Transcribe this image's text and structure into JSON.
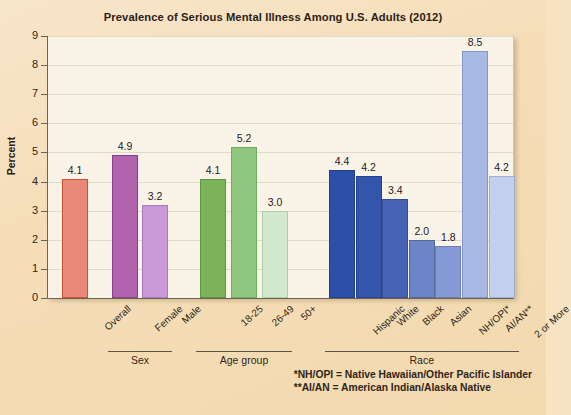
{
  "chart_data": {
    "type": "bar",
    "title": "Prevalence of Serious Mental Illness Among U.S. Adults (2012)",
    "xlabel": "",
    "ylabel": "Percent",
    "ylim": [
      0,
      9
    ],
    "yticks": [
      0,
      1,
      2,
      3,
      4,
      5,
      6,
      7,
      8,
      9
    ],
    "ytick_labels": [
      "0",
      "1",
      "2",
      "3",
      "4",
      "5",
      "6",
      "7",
      "8",
      "9"
    ],
    "grid": true,
    "legend": "none",
    "categories": [
      "Overall",
      "Female",
      "Male",
      "18-25",
      "26-49",
      "50+",
      "Hispanic",
      "White",
      "Black",
      "Asian",
      "NH/OPI*",
      "AI/AN**",
      "2 or More"
    ],
    "values": [
      4.1,
      4.9,
      3.2,
      4.1,
      5.2,
      3.0,
      4.4,
      4.2,
      3.4,
      2.0,
      1.8,
      8.5,
      4.2
    ],
    "value_labels": [
      "4.1",
      "4.9",
      "3.2",
      "4.1",
      "5.2",
      "3.0",
      "4.4",
      "4.2",
      "3.4",
      "2.0",
      "1.8",
      "8.5",
      "4.2"
    ],
    "bar_colors": [
      "#e8897a",
      "#b163ae",
      "#c99ad6",
      "#7cb259",
      "#8fc77e",
      "#d4e8cf",
      "#2c4fa8",
      "#3355ab",
      "#4663b4",
      "#6c85c8",
      "#8599d4",
      "#a8b9e3",
      "#c3cfec"
    ],
    "bar_edge_colors": [
      "#d1503a",
      "#8d3f8c",
      "#a87ac0",
      "#5c964a",
      "#6fae62",
      "#a9cfa4",
      "#1f3d8c",
      "#24408f",
      "#344f98",
      "#53699f",
      "#6a7fba",
      "#8496c8",
      "#9fafd6"
    ],
    "groups": [
      {
        "label": "Sex",
        "start": 1,
        "end": 2
      },
      {
        "label": "Age group",
        "start": 3,
        "end": 5
      },
      {
        "label": "Race",
        "start": 6,
        "end": 12
      }
    ],
    "annotations": [
      "*NH/OPI = Native Hawaiian/Other Pacific Islander",
      "**AI/AN = American Indian/Alaska Native"
    ]
  },
  "colors": {
    "page_background": "#f5ddb8",
    "plot_background": "#faf4e8",
    "axis": "#6b6354",
    "gridline": "#e2d9c6",
    "text": "#2f261a",
    "title_text": "#2c2117"
  },
  "footnotes": {
    "line1": "*NH/OPI = Native Hawaiian/Other Pacific Islander",
    "line2": "**AI/AN = American Indian/Alaska Native"
  }
}
